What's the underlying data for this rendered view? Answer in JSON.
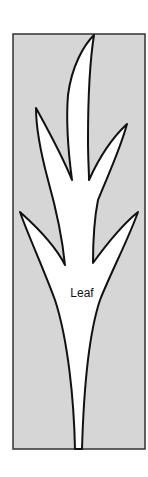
{
  "diagram": {
    "label": "Leaf",
    "colors": {
      "background": "#d6d6d6",
      "leaf_fill": "#ffffff",
      "outline": "#111111",
      "frame": "#333333"
    }
  }
}
